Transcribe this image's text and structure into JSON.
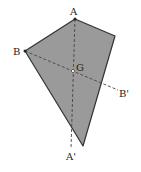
{
  "diagram": {
    "colors": {
      "fill": "#9a9a9a",
      "stroke": "#333333",
      "dash": "#555555",
      "background": "#ffffff"
    },
    "points": {
      "A": {
        "label": "A",
        "x": 75,
        "y": 19
      },
      "R": {
        "label": "",
        "x": 115,
        "y": 36
      },
      "B": {
        "label": "B",
        "x": 25,
        "y": 51
      },
      "G": {
        "label": "G",
        "x": 73,
        "y": 71
      },
      "D": {
        "label": "",
        "x": 83,
        "y": 146
      },
      "B_prime": {
        "label": "B'",
        "x": 120,
        "y": 90
      },
      "A_prime": {
        "label": "A'",
        "x": 71,
        "y": 150
      }
    },
    "labels": {
      "A": "A",
      "B": "B",
      "G": "G",
      "B_prime": "B'",
      "A_prime": "A'"
    }
  }
}
